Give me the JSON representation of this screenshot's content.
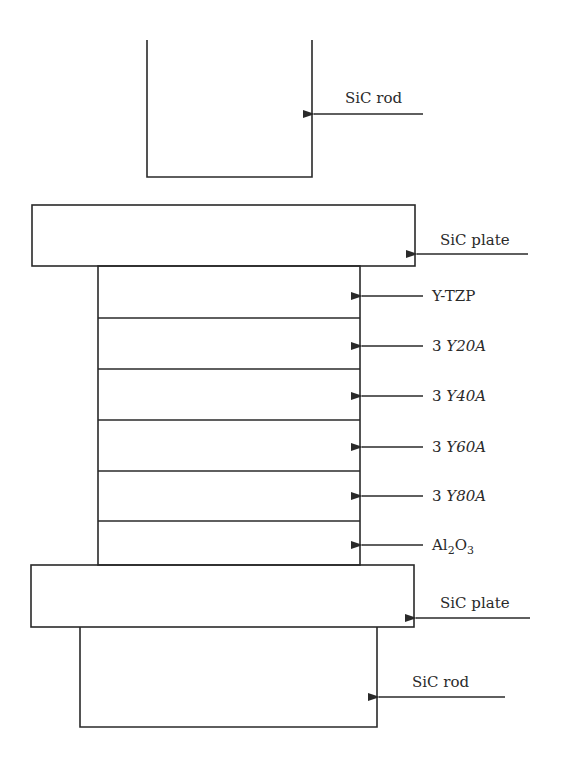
{
  "diagram": {
    "title": "",
    "components": [
      {
        "id": "top-rod",
        "label": "SiC rod"
      },
      {
        "id": "top-plate",
        "label": "SiC plate"
      },
      {
        "id": "layer-1",
        "label": "Y-TZP",
        "prefix": "",
        "italic": ""
      },
      {
        "id": "layer-2",
        "label": "3 Y20A",
        "prefix": "3 ",
        "italic": "Y20A"
      },
      {
        "id": "layer-3",
        "label": "3 Y40A",
        "prefix": "3 ",
        "italic": "Y40A"
      },
      {
        "id": "layer-4",
        "label": "3 Y60A",
        "prefix": "3 ",
        "italic": "Y60A"
      },
      {
        "id": "layer-5",
        "label": "3 Y80A",
        "prefix": "3 ",
        "italic": "Y80A"
      },
      {
        "id": "layer-6",
        "label": "Al2O3",
        "base": "Al",
        "sub1": "2",
        "mid": "O",
        "sub2": "3"
      },
      {
        "id": "bottom-plate",
        "label": "SiC plate"
      },
      {
        "id": "bottom-rod",
        "label": "SiC rod"
      }
    ],
    "labels": {
      "top_rod": "SiC rod",
      "top_plate": "SiC plate",
      "y_tzp": "Y-TZP",
      "l20_prefix": "3 ",
      "l20_italic": "Y20A",
      "l40_prefix": "3 ",
      "l40_italic": "Y40A",
      "l60_prefix": "3 ",
      "l60_italic": "Y60A",
      "l80_prefix": "3 ",
      "l80_italic": "Y80A",
      "al2o3_a": "Al",
      "al2o3_sub1": "2",
      "al2o3_b": "O",
      "al2o3_sub2": "3",
      "bottom_plate": "SiC plate",
      "bottom_rod": "SiC rod"
    }
  }
}
